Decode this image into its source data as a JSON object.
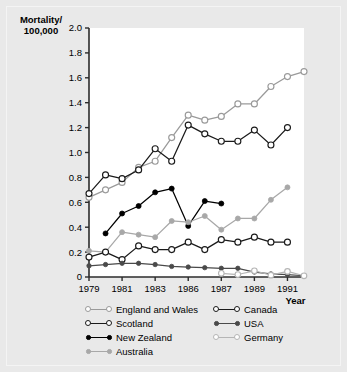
{
  "figure": {
    "background": "#e9e9e9",
    "plot_background": "#ffffff"
  },
  "axis": {
    "ylabel_line1": "Mortality/",
    "ylabel_line2": "100,000",
    "xlabel": "Year",
    "yticks": [
      "0",
      "0.2",
      "0.4",
      "0.6",
      "0.8",
      "1.0",
      "1.2",
      "1.4",
      "1.6",
      "1.8",
      "2.0"
    ],
    "xticks": [
      "1979",
      "1981",
      "1983",
      "1986",
      "1987",
      "1989",
      "1991"
    ]
  },
  "legend": {
    "left_column": [
      {
        "label": "England and Wales",
        "key": "england_and_wales"
      },
      {
        "label": "Scotland",
        "key": "scotland"
      },
      {
        "label": "New Zealand",
        "key": "new_zealand"
      },
      {
        "label": "Australia",
        "key": "australia"
      }
    ],
    "right_column": [
      {
        "label": "Canada",
        "key": "canada"
      },
      {
        "label": "USA",
        "key": "usa"
      },
      {
        "label": "Germany",
        "key": "germany"
      }
    ]
  },
  "chart_data": {
    "type": "line",
    "title": "",
    "xlabel": "Year",
    "ylabel": "Mortality/100,000",
    "xlim": [
      1979,
      1992
    ],
    "ylim": [
      0,
      2.0
    ],
    "grid": false,
    "legend_position": "bottom",
    "xtick_values": [
      1979,
      1981,
      1983,
      1985,
      1987,
      1989,
      1991
    ],
    "xtick_labels": [
      "1979",
      "1981",
      "1983",
      "1986",
      "1987",
      "1989",
      "1991"
    ],
    "ytick_values": [
      0,
      0.2,
      0.4,
      0.6,
      0.8,
      1.0,
      1.2,
      1.4,
      1.6,
      1.8,
      2.0
    ],
    "series": [
      {
        "name": "England and Wales",
        "color": "#9a9a9a",
        "marker": "open-circle",
        "marker_size": 4.2,
        "x": [
          1979,
          1980,
          1981,
          1982,
          1983,
          1984,
          1985,
          1986,
          1987,
          1988,
          1989,
          1990,
          1991,
          1992
        ],
        "values": [
          0.64,
          0.7,
          0.76,
          0.88,
          0.93,
          1.12,
          1.3,
          1.26,
          1.29,
          1.39,
          1.39,
          1.53,
          1.61,
          1.65
        ]
      },
      {
        "name": "Scotland",
        "color": "#1a1a1a",
        "marker": "open-circle",
        "marker_size": 4.2,
        "x": [
          1979,
          1980,
          1981,
          1982,
          1983,
          1984,
          1985,
          1986,
          1987,
          1988,
          1989,
          1990,
          1991
        ],
        "values": [
          0.67,
          0.82,
          0.79,
          0.86,
          1.03,
          0.93,
          1.22,
          1.15,
          1.09,
          1.09,
          1.18,
          1.06,
          1.2
        ]
      },
      {
        "name": "New Zealand",
        "color": "#000000",
        "marker": "filled-circle",
        "marker_size": 3.6,
        "x": [
          1980,
          1981,
          1982,
          1983,
          1984,
          1985,
          1986,
          1987
        ],
        "values": [
          0.35,
          0.51,
          0.57,
          0.68,
          0.71,
          0.41,
          0.61,
          0.59
        ]
      },
      {
        "name": "Australia",
        "color": "#a8a8a8",
        "marker": "filled-circle",
        "marker_size": 3.6,
        "x": [
          1979,
          1980,
          1981,
          1982,
          1983,
          1984,
          1985,
          1986,
          1987,
          1988,
          1989,
          1990,
          1991
        ],
        "values": [
          0.21,
          0.2,
          0.36,
          0.34,
          0.32,
          0.45,
          0.44,
          0.49,
          0.38,
          0.47,
          0.47,
          0.62,
          0.72
        ]
      },
      {
        "name": "Canada",
        "color": "#1a1a1a",
        "marker": "open-circle",
        "marker_size": 4.2,
        "x": [
          1979,
          1980,
          1981,
          1982,
          1983,
          1984,
          1985,
          1986,
          1987,
          1988,
          1989,
          1990,
          1991
        ],
        "values": [
          0.16,
          0.2,
          0.14,
          0.25,
          0.22,
          0.22,
          0.28,
          0.22,
          0.3,
          0.28,
          0.32,
          0.28,
          0.28
        ]
      },
      {
        "name": "USA",
        "color": "#4a4a4a",
        "marker": "filled-circle",
        "marker_size": 3.0,
        "x": [
          1979,
          1980,
          1981,
          1982,
          1983,
          1984,
          1985,
          1986,
          1987,
          1988,
          1989,
          1990,
          1991,
          1992
        ],
        "values": [
          0.09,
          0.1,
          0.11,
          0.11,
          0.1,
          0.085,
          0.08,
          0.075,
          0.07,
          0.07,
          0.04,
          0.025,
          0.02,
          0.01
        ]
      },
      {
        "name": "Germany",
        "color": "#b5b5b5",
        "marker": "open-circle",
        "marker_size": 3.8,
        "x": [
          1987,
          1988,
          1989,
          1990,
          1991,
          1992
        ],
        "values": [
          0.03,
          0.02,
          0.05,
          0.015,
          0.045,
          0.01
        ]
      }
    ]
  }
}
